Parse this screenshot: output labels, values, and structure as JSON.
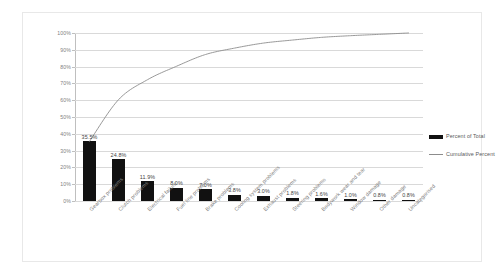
{
  "chart_data": {
    "type": "bar",
    "title": "",
    "subtitle": "",
    "xlabel": "",
    "ylabel": "",
    "ylim": [
      0,
      100
    ],
    "grid": true,
    "legend_position": "right",
    "categories": [
      "Gearbox problems",
      "Clutch problems",
      "Electrical failure",
      "Fuel line problems",
      "Brake problems",
      "Cooling system problems",
      "Exhaust problems",
      "Steering problems",
      "Bodywork wear and tear",
      "Window damage",
      "Other damage",
      "Uncategorised"
    ],
    "series": [
      {
        "name": "Percent of Total",
        "type": "bar",
        "values": [
          35.5,
          24.8,
          11.9,
          8.0,
          7.0,
          3.8,
          3.0,
          1.8,
          1.6,
          1.0,
          0.8,
          0.8
        ],
        "labels": [
          "35.5%",
          "24.8%",
          "11.9%",
          "8.0%",
          "7.0%",
          "3.8%",
          "3.0%",
          "1.8%",
          "1.6%",
          "1.0%",
          "0.8%",
          "0.8%"
        ],
        "color": "#111111"
      },
      {
        "name": "Cumulative Percent",
        "type": "line",
        "values": [
          35.5,
          60.3,
          72.2,
          80.2,
          87.2,
          91.0,
          94.0,
          95.8,
          97.4,
          98.4,
          99.2,
          100.0
        ],
        "color": "#8c8c8c"
      }
    ],
    "yticks": [
      "0%",
      "10%",
      "20%",
      "30%",
      "40%",
      "50%",
      "60%",
      "70%",
      "80%",
      "90%",
      "100%"
    ],
    "ytick_values": [
      0,
      10,
      20,
      30,
      40,
      50,
      60,
      70,
      80,
      90,
      100
    ]
  },
  "legend": {
    "items": [
      {
        "label": "Percent of Total",
        "marker": "bar-swatch"
      },
      {
        "label": "Cumulative Percent",
        "marker": "line-swatch"
      }
    ]
  }
}
